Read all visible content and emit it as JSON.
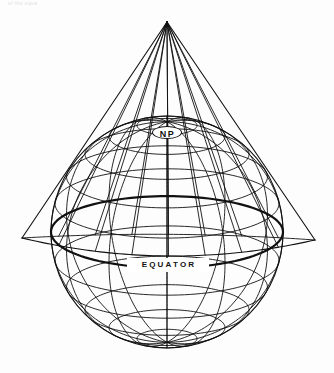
{
  "figure": {
    "kind": "diagram",
    "caption_fragment": "of the equa",
    "background_color": "#fdfdfd",
    "ink_color": "#111111",
    "width": 334,
    "height": 373
  },
  "labels": {
    "north_pole": "NP",
    "equator": "EQUATOR"
  },
  "globe": {
    "center_x": 167,
    "center_y": 232,
    "radius": 116,
    "tilt_degrees": 18,
    "meridian_count": 12,
    "meridian_spacing_degrees": 30,
    "parallel_spacing_degrees": 15,
    "equator_emphasis": true,
    "north_pole_x": 167,
    "north_pole_y": 133
  },
  "cone": {
    "apex_x": 167,
    "apex_y": 22,
    "left_base_x": 22,
    "left_base_y": 238,
    "right_base_x": 315,
    "right_base_y": 240,
    "base_arc_sag": 17,
    "generator_count": 9,
    "tangent_latitude_degrees": 45
  },
  "stroke": {
    "thin": 0.9,
    "medium": 1.1,
    "thick": 2.2
  }
}
